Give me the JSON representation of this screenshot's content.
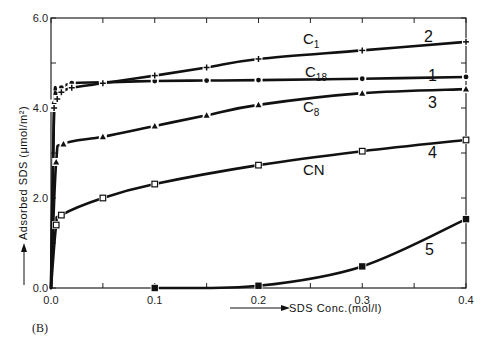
{
  "panel_label": "(B)",
  "chart_data": {
    "type": "line",
    "title": "",
    "xlabel": "SDS Conc.(mol/l)",
    "ylabel": "Adsorbed SDS (μmol/m²)",
    "xlim": [
      0.0,
      0.4
    ],
    "ylim": [
      0.0,
      6.0
    ],
    "x_ticks": [
      "0.0",
      "0.1",
      "0.2",
      "0.3",
      "0.4"
    ],
    "y_ticks": [
      "0.0",
      "2.0",
      "4.0",
      "6.0"
    ],
    "grid": false,
    "legend": "inline labels",
    "series": [
      {
        "name": "C18",
        "number": "1",
        "label": "C",
        "sub": "18",
        "marker": "dot",
        "x": [
          0.0,
          0.003,
          0.006,
          0.01,
          0.02,
          0.05,
          0.1,
          0.15,
          0.2,
          0.3,
          0.4
        ],
        "values": [
          0.0,
          4.1,
          4.3,
          4.45,
          4.55,
          4.57,
          4.6,
          4.61,
          4.62,
          4.65,
          4.69
        ]
      },
      {
        "name": "C1",
        "number": "2",
        "label": "C",
        "sub": "1",
        "marker": "plus",
        "x": [
          0.0,
          0.003,
          0.006,
          0.01,
          0.02,
          0.05,
          0.1,
          0.15,
          0.2,
          0.3,
          0.4
        ],
        "values": [
          0.0,
          4.0,
          4.2,
          4.35,
          4.45,
          4.55,
          4.72,
          4.9,
          5.09,
          5.28,
          5.47
        ]
      },
      {
        "name": "C8",
        "number": "3",
        "label": "C",
        "sub": "8",
        "marker": "triangle",
        "x": [
          0.0,
          0.005,
          0.012,
          0.05,
          0.1,
          0.15,
          0.2,
          0.3,
          0.4
        ],
        "values": [
          0.0,
          2.8,
          3.2,
          3.36,
          3.6,
          3.84,
          4.07,
          4.33,
          4.42
        ]
      },
      {
        "name": "CN",
        "number": "4",
        "label": "CN",
        "sub": "",
        "marker": "open-square",
        "x": [
          0.0,
          0.005,
          0.01,
          0.05,
          0.1,
          0.2,
          0.3,
          0.4
        ],
        "values": [
          0.0,
          1.4,
          1.62,
          2.0,
          2.31,
          2.73,
          3.04,
          3.29
        ]
      },
      {
        "name": "Curve 5",
        "number": "5",
        "label": "",
        "sub": "",
        "marker": "filled-square",
        "x": [
          0.1,
          0.2,
          0.3,
          0.4
        ],
        "values": [
          0.0,
          0.05,
          0.48,
          1.53
        ]
      }
    ]
  }
}
